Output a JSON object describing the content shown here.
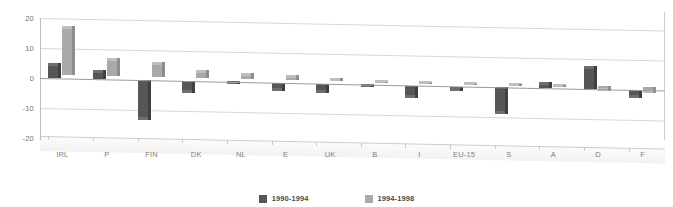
{
  "chart_data": {
    "type": "bar",
    "title": "",
    "xlabel": "",
    "ylabel": "",
    "ylim": [
      -20,
      20
    ],
    "yticks": [
      20,
      10,
      0,
      -10,
      -20
    ],
    "grid": true,
    "legend_position": "bottom",
    "style": "3d-clustered-column",
    "categories": [
      "IRL",
      "P",
      "FIN",
      "DK",
      "NL",
      "E",
      "UK",
      "B",
      "I",
      "EU-15",
      "S",
      "A",
      "D",
      "F"
    ],
    "series": [
      {
        "name": "1990-1994",
        "color": "#565656",
        "values": [
          5.0,
          3.2,
          -13.2,
          -4.0,
          -0.6,
          -2.6,
          -3.2,
          -0.9,
          -4.2,
          -1.6,
          -9.0,
          2.2,
          7.6,
          -2.6
        ]
      },
      {
        "name": "1994-1998",
        "color": "#a9a9a9",
        "values": [
          16.6,
          6.2,
          5.0,
          2.6,
          2.0,
          1.6,
          0.9,
          -0.5,
          -0.4,
          -0.4,
          -0.5,
          -0.6,
          -1.6,
          -2.1
        ]
      }
    ]
  },
  "axis": {
    "ytick_labels": [
      "20",
      "10",
      "0",
      "-10",
      "-20"
    ]
  },
  "legend": {
    "items": [
      {
        "label": "1990-1994",
        "color": "#565656",
        "swatch_name": "legend-swatch-1990-1994"
      },
      {
        "label": "1994-1998",
        "color": "#a9a9a9",
        "swatch_name": "legend-swatch-1994-1998"
      }
    ]
  }
}
